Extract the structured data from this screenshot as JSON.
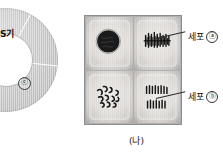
{
  "figure": {
    "caption": "(나)",
    "accent_color": "#2b2b2b",
    "tile_background": "#e8e5e2",
    "chromatin_color": "#1a1a1a"
  },
  "cycle_diagram": {
    "name": "cell-cycle-donut",
    "note_visible": "partially cropped at left edge",
    "sector_label_s_phase": "S기",
    "marker_c": "ⓒ",
    "marker_d": "ⓓ"
  },
  "micrographs": {
    "name": "mitosis-stage-grid",
    "rows": 2,
    "columns": 2,
    "tiles": [
      {
        "position": "top-left",
        "icon": "interphase-nucleus-icon"
      },
      {
        "position": "top-right",
        "icon": "metaphase-plate-icon"
      },
      {
        "position": "bottom-left",
        "icon": "prophase-chromosomes-icon"
      },
      {
        "position": "bottom-right",
        "icon": "anaphase-separation-icon"
      }
    ]
  },
  "labels": {
    "cell_a": {
      "text": "세포",
      "marker": "ⓐ"
    },
    "cell_b": {
      "text": "세포",
      "marker": "ⓑ"
    }
  }
}
